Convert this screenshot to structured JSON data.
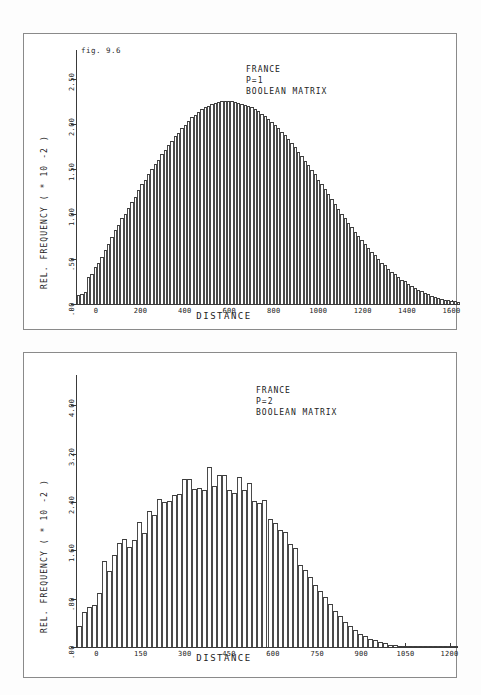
{
  "figure": {
    "label": "fig. 9.6"
  },
  "panels": [
    {
      "id": "panel-1",
      "annotation": {
        "country": "FRANCE",
        "parameter": "P=1",
        "matrix": "BOOLEAN MATRIX"
      },
      "chart_data": {
        "type": "bar",
        "title": "",
        "subtitle": "fig. 9.6",
        "xlabel": "DISTANCE",
        "ylabel": "REL. FREQUENCY ( * 10  -2 )",
        "grid": false,
        "legend": null,
        "xlim": [
          -90,
          1620
        ],
        "ylim": [
          0,
          2.75
        ],
        "xticks": [
          0,
          200,
          400,
          600,
          800,
          1000,
          1200,
          1400,
          1600
        ],
        "xtick_labels": [
          "0",
          "200",
          "400",
          "600",
          "800",
          "1000",
          "1200",
          "1400",
          "1600"
        ],
        "yticks": [
          0,
          0.5,
          1.0,
          1.5,
          2.0,
          2.5
        ],
        "ytick_labels": [
          ".00",
          ".50",
          "1.00",
          "1.50",
          "2.00",
          "2.50"
        ],
        "bin_width": 15,
        "x_start": -85,
        "values": [
          0.1,
          0.11,
          0.13,
          0.3,
          0.33,
          0.41,
          0.46,
          0.52,
          0.6,
          0.66,
          0.74,
          0.82,
          0.88,
          0.95,
          1.0,
          1.06,
          1.13,
          1.19,
          1.26,
          1.33,
          1.38,
          1.44,
          1.5,
          1.55,
          1.6,
          1.66,
          1.71,
          1.76,
          1.81,
          1.86,
          1.9,
          1.95,
          1.99,
          2.03,
          2.07,
          2.1,
          2.13,
          2.16,
          2.18,
          2.2,
          2.22,
          2.23,
          2.24,
          2.25,
          2.25,
          2.25,
          2.25,
          2.24,
          2.23,
          2.22,
          2.21,
          2.2,
          2.18,
          2.16,
          2.14,
          2.11,
          2.08,
          2.05,
          2.02,
          1.99,
          1.95,
          1.91,
          1.87,
          1.83,
          1.79,
          1.74,
          1.69,
          1.64,
          1.59,
          1.54,
          1.49,
          1.44,
          1.38,
          1.33,
          1.27,
          1.22,
          1.16,
          1.11,
          1.05,
          1.0,
          0.95,
          0.9,
          0.85,
          0.8,
          0.75,
          0.71,
          0.66,
          0.62,
          0.58,
          0.54,
          0.5,
          0.46,
          0.43,
          0.39,
          0.36,
          0.33,
          0.3,
          0.27,
          0.25,
          0.22,
          0.2,
          0.18,
          0.16,
          0.14,
          0.12,
          0.11,
          0.09,
          0.08,
          0.07,
          0.06,
          0.05,
          0.045,
          0.038,
          0.032,
          0.027,
          0.022,
          0.018,
          0.015,
          0.012,
          0.01,
          0.008,
          0.006,
          0.005,
          0.004,
          0.003,
          0.002,
          0.002,
          0.001,
          0.001,
          0.001,
          0.001,
          0.0,
          0.0,
          0.0,
          0.0,
          0.0,
          0.0,
          0.0,
          0.0,
          0.0,
          0.0,
          0.0,
          0.0,
          0.0,
          0.0,
          0.0,
          0.0,
          0.0,
          0.0,
          0.0,
          0.0,
          0.0,
          0.0,
          0.0,
          0.0,
          0.0,
          0.0,
          0.0,
          0.0,
          0.0,
          0.0,
          0.0,
          0.0,
          0.0,
          0.0,
          0.0,
          0.0,
          0.0,
          0.0,
          0.0
        ]
      }
    },
    {
      "id": "panel-2",
      "annotation": {
        "country": "FRANCE",
        "parameter": "P=2",
        "matrix": "BOOLEAN MATRIX"
      },
      "chart_data": {
        "type": "bar",
        "title": "",
        "xlabel": "DISTANCE",
        "ylabel": "REL. FREQUENCY ( * 10  -2 )",
        "grid": false,
        "legend": null,
        "xlim": [
          -70,
          1215
        ],
        "ylim": [
          0,
          4.4
        ],
        "xticks": [
          0,
          150,
          300,
          450,
          600,
          750,
          900,
          1050,
          1200
        ],
        "xtick_labels": [
          "0",
          "150",
          "300",
          "450",
          "600",
          "750",
          "900",
          "1050",
          "1200"
        ],
        "yticks": [
          0,
          0.8,
          1.6,
          2.4,
          3.2,
          4.0
        ],
        "ytick_labels": [
          ".00",
          ".80",
          "1.60",
          "2.40",
          "3.20",
          "4.00"
        ],
        "bin_width": 17,
        "x_start": -65,
        "values": [
          0.35,
          0.58,
          0.66,
          0.7,
          0.9,
          1.42,
          1.26,
          1.52,
          1.72,
          1.78,
          1.66,
          1.77,
          2.06,
          1.88,
          2.25,
          2.18,
          2.45,
          2.4,
          2.42,
          2.52,
          2.53,
          2.78,
          2.78,
          2.62,
          2.63,
          2.6,
          2.97,
          2.66,
          2.85,
          2.84,
          2.6,
          2.55,
          2.82,
          2.59,
          2.72,
          2.42,
          2.38,
          2.43,
          2.11,
          2.05,
          1.93,
          1.91,
          1.7,
          1.63,
          1.35,
          1.28,
          1.15,
          1.02,
          0.93,
          0.82,
          0.71,
          0.6,
          0.52,
          0.42,
          0.34,
          0.28,
          0.22,
          0.18,
          0.14,
          0.11,
          0.08,
          0.06,
          0.04,
          0.03,
          0.02,
          0.015,
          0.01,
          0.008,
          0.005,
          0.003,
          0.002,
          0.001,
          0.001,
          0.0,
          0.0,
          0.0
        ]
      }
    }
  ]
}
